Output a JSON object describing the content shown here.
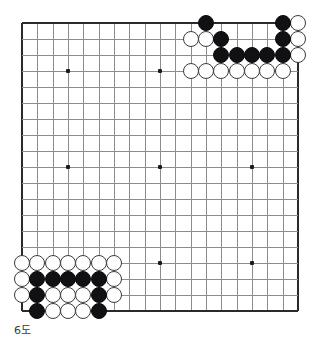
{
  "figure": {
    "kind": "go-board-diagram",
    "caption": "6도",
    "top_caption": "",
    "board_size": 19,
    "star_points_lines": [
      4,
      10,
      16
    ]
  },
  "colors": {
    "background": "#ffffff",
    "grid_line": "#8b8b90",
    "grid_edge": "#2a2a2e",
    "black_stone": "#111114",
    "white_stone": "#ffffff",
    "white_stone_border": "#3a3a40",
    "caption_text": "#3a3a40"
  },
  "geometry": {
    "origin_x": 22,
    "origin_y": 23,
    "step_x": 15.33,
    "step_y": 16.0,
    "stone_diameter": 16
  },
  "stones": {
    "black": [
      {
        "col": 12,
        "row": 0
      },
      {
        "col": 17,
        "row": 0
      },
      {
        "col": 13,
        "row": 1
      },
      {
        "col": 17,
        "row": 1
      },
      {
        "col": 13,
        "row": 2
      },
      {
        "col": 14,
        "row": 2
      },
      {
        "col": 15,
        "row": 2
      },
      {
        "col": 16,
        "row": 2
      },
      {
        "col": 17,
        "row": 2
      },
      {
        "col": 1,
        "row": 16
      },
      {
        "col": 2,
        "row": 16
      },
      {
        "col": 3,
        "row": 16
      },
      {
        "col": 4,
        "row": 16
      },
      {
        "col": 5,
        "row": 16
      },
      {
        "col": 1,
        "row": 17
      },
      {
        "col": 5,
        "row": 17
      },
      {
        "col": 1,
        "row": 18
      },
      {
        "col": 5,
        "row": 18
      }
    ],
    "white": [
      {
        "col": 18,
        "row": 0
      },
      {
        "col": 11,
        "row": 1
      },
      {
        "col": 12,
        "row": 1
      },
      {
        "col": 18,
        "row": 1
      },
      {
        "col": 18,
        "row": 2
      },
      {
        "col": 11,
        "row": 3
      },
      {
        "col": 12,
        "row": 3
      },
      {
        "col": 13,
        "row": 3
      },
      {
        "col": 14,
        "row": 3
      },
      {
        "col": 15,
        "row": 3
      },
      {
        "col": 16,
        "row": 3
      },
      {
        "col": 17,
        "row": 3
      },
      {
        "col": 0,
        "row": 15
      },
      {
        "col": 1,
        "row": 15
      },
      {
        "col": 2,
        "row": 15
      },
      {
        "col": 3,
        "row": 15
      },
      {
        "col": 4,
        "row": 15
      },
      {
        "col": 5,
        "row": 15
      },
      {
        "col": 6,
        "row": 15
      },
      {
        "col": 0,
        "row": 16
      },
      {
        "col": 6,
        "row": 16
      },
      {
        "col": 0,
        "row": 17
      },
      {
        "col": 2,
        "row": 17
      },
      {
        "col": 3,
        "row": 17
      },
      {
        "col": 4,
        "row": 17
      },
      {
        "col": 6,
        "row": 17
      },
      {
        "col": 2,
        "row": 18
      },
      {
        "col": 3,
        "row": 18
      },
      {
        "col": 4,
        "row": 18
      }
    ]
  }
}
